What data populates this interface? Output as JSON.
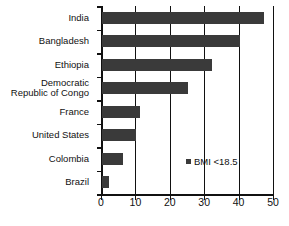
{
  "chart_data": {
    "type": "bar",
    "orientation": "horizontal",
    "title": "",
    "subtitle": "",
    "xlabel": "",
    "ylabel": "",
    "xlim": [
      0,
      50
    ],
    "xticks": [
      0,
      10,
      20,
      30,
      40,
      50
    ],
    "xtick_labels": [
      "0",
      "10",
      "20",
      "30",
      "40",
      "50"
    ],
    "grid": true,
    "grid_axis": "x",
    "legend": {
      "position": "inside-right",
      "entries": [
        {
          "label": "BMI <18.5",
          "color": "#3a3a3a",
          "marker": "square"
        }
      ]
    },
    "categories": [
      "India",
      "Bangladesh",
      "Ethiopia",
      "Democratic\nRepublic of Congo",
      "France",
      "United States",
      "Colombia",
      "Brazil"
    ],
    "series": [
      {
        "name": "BMI <18.5",
        "color": "#3a3a3a",
        "values": [
          47,
          40,
          32,
          25,
          11,
          10,
          6,
          2
        ]
      }
    ]
  },
  "colors": {
    "bar": "#3a3a3a",
    "axis": "#111111",
    "background": "#ffffff",
    "text": "#111111"
  }
}
